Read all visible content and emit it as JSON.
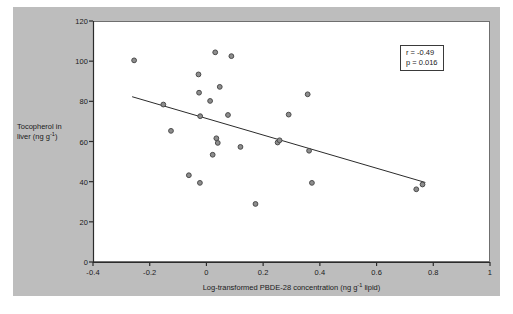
{
  "figure": {
    "background_color": "#bdbdbd",
    "plot_background_color": "#ffffff",
    "marker_fill": "#8d8d8d",
    "marker_stroke": "#4a4a4a",
    "axis_color": "#2b2b2b",
    "trendline_color": "#2b2b2b"
  },
  "annotations": {
    "r_label": "r = -0.49",
    "p_label": "p = 0.016"
  },
  "axis_titles": {
    "y_line1": "Tocopherol in",
    "y_line2_prefix": "liver (ng g",
    "y_line2_sup": "-1",
    "y_line2_suffix": ")",
    "x_prefix": "Log-transformed PBDE-28 concentration (ng g",
    "x_sup": "-1",
    "x_suffix": " lipid)"
  },
  "chart_data": {
    "type": "scatter",
    "title": "",
    "xlabel": "Log-transformed PBDE-28 concentration (ng g-1 lipid)",
    "ylabel": "Tocopherol in liver (ng g-1)",
    "xlim": [
      -0.4,
      1.0
    ],
    "ylim": [
      0,
      120
    ],
    "xticks": [
      -0.4,
      -0.2,
      0,
      0.2,
      0.4,
      0.6,
      0.8,
      1
    ],
    "xtick_labels": [
      "-0.4",
      "-0.2",
      "0",
      "0.2",
      "0.4",
      "0.6",
      "0.8",
      "1"
    ],
    "yticks": [
      0,
      20,
      40,
      60,
      80,
      100,
      120
    ],
    "ytick_labels": [
      "0",
      "20",
      "40",
      "60",
      "80",
      "100",
      "120"
    ],
    "grid": false,
    "legend": "none",
    "statistics": {
      "r": -0.49,
      "p": 0.016
    },
    "series": [
      {
        "name": "Samples",
        "marker": "circle",
        "points": [
          [
            -0.255,
            100.4
          ],
          [
            -0.152,
            78.4
          ],
          [
            -0.125,
            65.3
          ],
          [
            -0.062,
            43.2
          ],
          [
            -0.026,
            84.3
          ],
          [
            -0.028,
            93.4
          ],
          [
            -0.022,
            72.6
          ],
          [
            -0.023,
            39.4
          ],
          [
            0.013,
            80.2
          ],
          [
            0.022,
            53.4
          ],
          [
            0.031,
            104.4
          ],
          [
            0.035,
            61.6
          ],
          [
            0.04,
            59.3
          ],
          [
            0.047,
            87.2
          ],
          [
            0.076,
            73.2
          ],
          [
            0.088,
            102.5
          ],
          [
            0.12,
            57.3
          ],
          [
            0.173,
            28.9
          ],
          [
            0.251,
            59.5
          ],
          [
            0.258,
            60.6
          ],
          [
            0.29,
            73.4
          ],
          [
            0.357,
            83.5
          ],
          [
            0.362,
            55.4
          ],
          [
            0.372,
            39.4
          ],
          [
            0.74,
            36.2
          ],
          [
            0.762,
            38.6
          ]
        ]
      }
    ],
    "trendline": {
      "name": "Linear fit",
      "x_start": -0.262,
      "y_start": 82.3,
      "x_end": 0.772,
      "y_end": 39.6
    }
  }
}
